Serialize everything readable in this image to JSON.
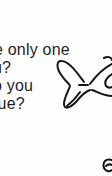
{
  "page": {
    "background": "#fefefe",
    "text_color": "#1e1e1e"
  },
  "text_lines": [
    {
      "text": "e only one"
    },
    {
      "text": "u?"
    },
    {
      "text": "o you"
    },
    {
      "text": "rue?"
    }
  ],
  "illustrations": [
    {
      "name": "bow-drawing",
      "description": "hand-drawn ribbon bow outline"
    },
    {
      "name": "partial-drawing",
      "description": "partial curled outline at bottom right"
    }
  ]
}
